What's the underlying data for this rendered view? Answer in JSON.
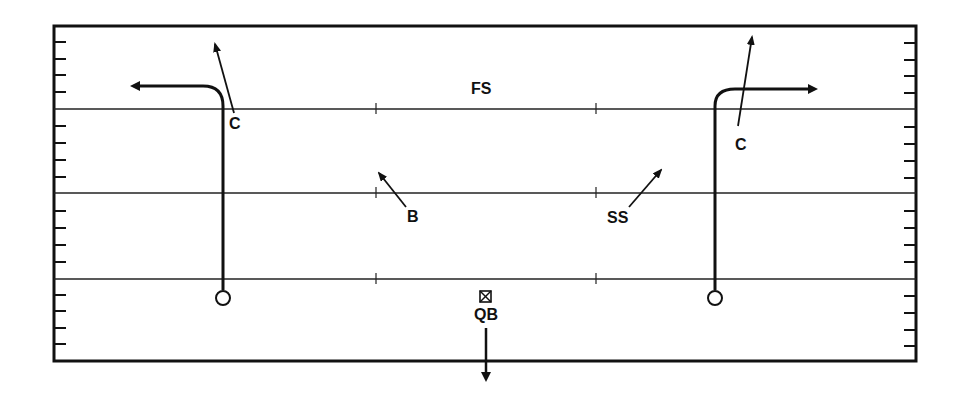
{
  "diagram": {
    "type": "football-play",
    "colors": {
      "ink": "#111111",
      "background": "#ffffff"
    },
    "labels": {
      "free_safety": "FS",
      "left_corner": "C",
      "right_corner": "C",
      "linebacker": "B",
      "strong_safety": "SS",
      "quarterback": "QB"
    },
    "players": [
      {
        "role": "receiver-left",
        "symbol": "circle"
      },
      {
        "role": "receiver-right",
        "symbol": "circle"
      },
      {
        "role": "quarterback",
        "symbol": "boxed-x"
      }
    ]
  }
}
